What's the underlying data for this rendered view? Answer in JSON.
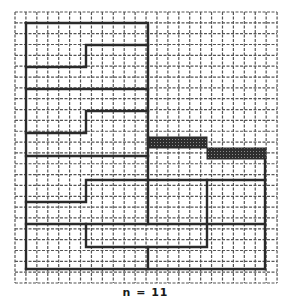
{
  "caption": "n = 11",
  "grid": {
    "origin_x": 15,
    "origin_y": 12,
    "cols": 24,
    "rows": 25,
    "cell_w": 10.92,
    "cell_h": 10.84,
    "line_color": "#555555"
  },
  "colors": {
    "thick_line": "#2a2a2a",
    "shaded_fill": "#3a3a3a",
    "background": "#ffffff"
  },
  "thick_paths": [
    {
      "name": "outer-left-region",
      "points": "26,23 148,23 148,137"
    },
    {
      "name": "left-edge",
      "points": "26,23 26,269"
    },
    {
      "name": "step-1",
      "points": "148,45 86,45 86,67 26,67"
    },
    {
      "name": "row-89",
      "points": "26,89 148,89"
    },
    {
      "name": "step-2",
      "points": "148,111 86,111 86,133 26,133"
    },
    {
      "name": "row-156",
      "points": "26,156 148,156"
    },
    {
      "name": "step-3",
      "points": "265,180 86,180 86,202 26,202"
    },
    {
      "name": "row-224",
      "points": "26,224 265,224"
    },
    {
      "name": "inner-rect",
      "points": "86,224 86,247 207,247 207,180"
    },
    {
      "name": "mid-vertical",
      "points": "148,247 148,269"
    },
    {
      "name": "right-edge",
      "points": "265,159 265,269"
    },
    {
      "name": "bottom-edge",
      "points": "26,269 265,269"
    },
    {
      "name": "mid-left-vertical",
      "points": "148,137 148,224"
    }
  ],
  "shaded_bars": [
    {
      "name": "shaded-bar-1",
      "x": 148,
      "y": 137,
      "w": 59,
      "h": 11
    },
    {
      "name": "shaded-bar-2",
      "x": 207,
      "y": 148,
      "w": 59,
      "h": 11
    }
  ]
}
